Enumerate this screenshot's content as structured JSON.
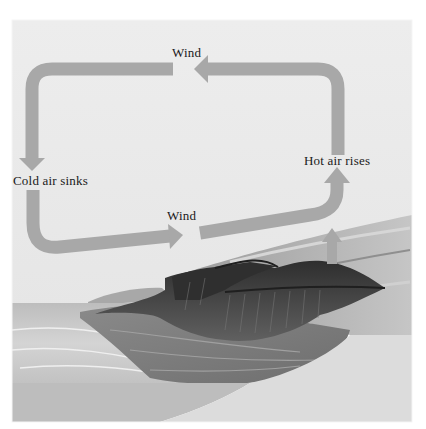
{
  "diagram": {
    "type": "sea-breeze convection cell",
    "labels": {
      "wind_top": "Wind",
      "cold_air": "Cold air sinks",
      "hot_air": "Hot air rises",
      "wind_bottom": "Wind"
    },
    "colors": {
      "sky": "#ebebeb",
      "arrow": "#a8a8a8",
      "sea": "#c9c9c9",
      "land": "#b4b4b4",
      "cliff": "#3c3c3c",
      "ground_base": "#bdbdbd",
      "ground_light": "#dcdcdc",
      "text": "#1a1a1a"
    }
  }
}
